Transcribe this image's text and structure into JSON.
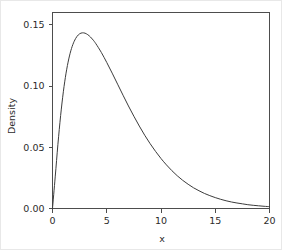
{
  "chart_data": {
    "type": "line",
    "title": "",
    "subtitle": "",
    "xlabel": "x",
    "ylabel": "Density",
    "xlim": [
      0,
      20
    ],
    "ylim": [
      0,
      0.16
    ],
    "grid": false,
    "legend": null,
    "legend_position": "none",
    "x_ticks": [
      0,
      5,
      10,
      15,
      20
    ],
    "x_tick_labels": [
      "0",
      "5",
      "10",
      "15",
      "20"
    ],
    "y_ticks": [
      0.0,
      0.05,
      0.1,
      0.15
    ],
    "y_tick_labels": [
      "0.00",
      "0.05",
      "0.10",
      "0.15"
    ],
    "series": [
      {
        "name": "Density",
        "color": "#3c3c3c",
        "x": [
          0.0,
          0.25,
          0.5,
          0.75,
          1.0,
          1.25,
          1.5,
          1.75,
          2.0,
          2.25,
          2.5,
          2.75,
          3.0,
          3.25,
          3.5,
          3.75,
          4.0,
          4.5,
          5.0,
          5.5,
          6.0,
          6.5,
          7.0,
          7.5,
          8.0,
          8.5,
          9.0,
          9.5,
          10.0,
          10.5,
          11.0,
          11.5,
          12.0,
          12.5,
          13.0,
          13.5,
          14.0,
          14.5,
          15.0,
          15.5,
          16.0,
          16.5,
          17.0,
          17.5,
          18.0,
          18.5,
          19.0,
          19.5,
          20.0
        ],
        "values": [
          0.0,
          0.0258,
          0.0524,
          0.0759,
          0.0953,
          0.1105,
          0.1221,
          0.1306,
          0.1365,
          0.1404,
          0.1426,
          0.1434,
          0.1431,
          0.1419,
          0.14,
          0.1375,
          0.1345,
          0.1274,
          0.1192,
          0.1105,
          0.1015,
          0.0925,
          0.0837,
          0.0753,
          0.0673,
          0.0598,
          0.0529,
          0.0466,
          0.0408,
          0.0356,
          0.0309,
          0.0267,
          0.023,
          0.0198,
          0.0169,
          0.0145,
          0.0123,
          0.0105,
          0.0089,
          0.0075,
          0.0063,
          0.0053,
          0.0045,
          0.0038,
          0.0031,
          0.0026,
          0.0022,
          0.0018,
          0.0015
        ]
      }
    ],
    "peak": {
      "x": 3.0,
      "y": 0.153
    },
    "colors": {
      "background": "#ffffff",
      "axis": "#4d4d4d",
      "curve": "#3c3c3c",
      "text": "#2b2b2b",
      "image_border": "#e8e8e8"
    }
  }
}
